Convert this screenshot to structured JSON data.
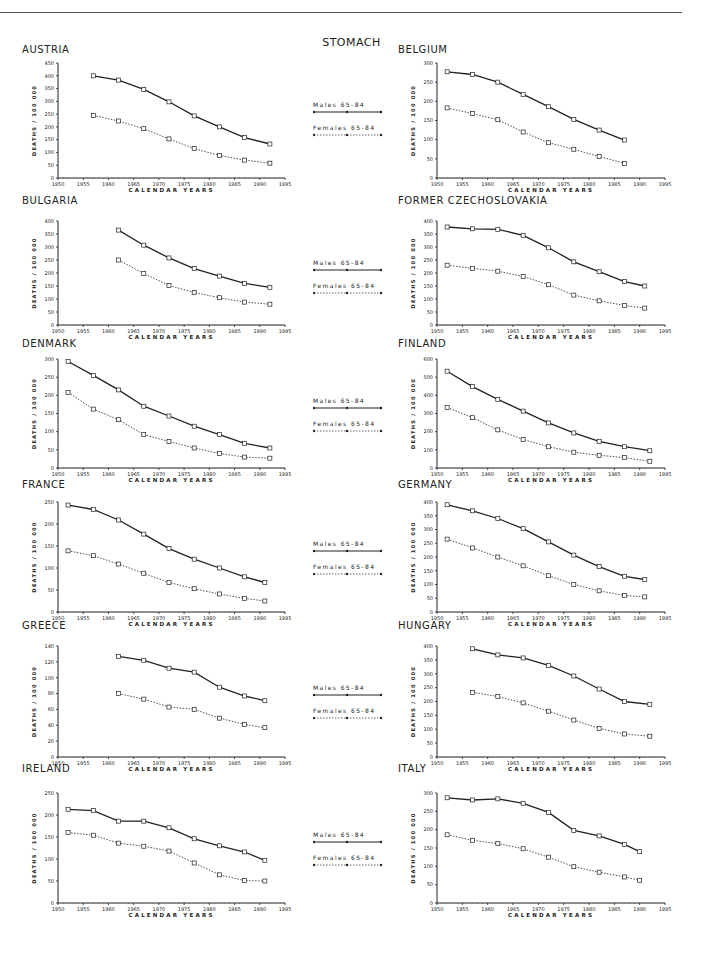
{
  "page": {
    "title": "STOMACH"
  },
  "legend": {
    "males": "Males 65-84",
    "females": "Females 65-84"
  },
  "axes": {
    "xlabel": "CALENDAR YEARS",
    "ylabel": "DEATHS / 100 000",
    "xticks": [
      1950,
      1955,
      1960,
      1965,
      1970,
      1975,
      1980,
      1985,
      1990,
      1995
    ]
  },
  "chart_data": [
    {
      "type": "line",
      "title": "AUSTRIA",
      "xlabel": "CALENDAR YEARS",
      "ylabel": "DEATHS / 100 000",
      "ylim": [
        0,
        450
      ],
      "ystep": 50,
      "x": [
        1957,
        1962,
        1967,
        1972,
        1977,
        1982,
        1987,
        1992
      ],
      "series": [
        {
          "name": "Males 65-84",
          "values": [
            400,
            383,
            347,
            298,
            243,
            200,
            158,
            133
          ]
        },
        {
          "name": "Females 65-84",
          "values": [
            245,
            223,
            193,
            153,
            115,
            88,
            70,
            58
          ]
        }
      ]
    },
    {
      "type": "line",
      "title": "BELGIUM",
      "xlabel": "CALENDAR YEARS",
      "ylabel": "DEATHS / 100 000",
      "ylim": [
        0,
        300
      ],
      "ystep": 50,
      "x": [
        1952,
        1957,
        1962,
        1967,
        1972,
        1977,
        1982,
        1987
      ],
      "series": [
        {
          "name": "Males 65-84",
          "values": [
            277,
            270,
            250,
            218,
            186,
            153,
            125,
            99
          ]
        },
        {
          "name": "Females 65-84",
          "values": [
            183,
            168,
            152,
            120,
            92,
            75,
            56,
            38
          ]
        }
      ]
    },
    {
      "type": "line",
      "title": "BULGARIA",
      "xlabel": "CALENDAR YEARS",
      "ylabel": "DEATHS / 100 000",
      "ylim": [
        0,
        400
      ],
      "ystep": 50,
      "x": [
        1962,
        1967,
        1972,
        1977,
        1982,
        1987,
        1992
      ],
      "series": [
        {
          "name": "Males 65-84",
          "values": [
            365,
            307,
            258,
            217,
            188,
            160,
            145
          ]
        },
        {
          "name": "Females 65-84",
          "values": [
            250,
            198,
            152,
            125,
            105,
            88,
            80
          ]
        }
      ]
    },
    {
      "type": "line",
      "title": "FORMER CZECHOSLOVAKIA",
      "xlabel": "CALENDAR YEARS",
      "ylabel": "DEATHS / 100 000",
      "ylim": [
        0,
        400
      ],
      "ystep": 50,
      "x": [
        1952,
        1957,
        1962,
        1967,
        1972,
        1977,
        1982,
        1987,
        1991
      ],
      "series": [
        {
          "name": "Males 65-84",
          "values": [
            377,
            370,
            368,
            345,
            297,
            243,
            205,
            167,
            150
          ]
        },
        {
          "name": "Females 65-84",
          "values": [
            230,
            218,
            207,
            187,
            155,
            115,
            93,
            75,
            65
          ]
        }
      ]
    },
    {
      "type": "line",
      "title": "DENMARK",
      "xlabel": "CALENDAR YEARS",
      "ylabel": "DEATHS / 100 000",
      "ylim": [
        0,
        300
      ],
      "ystep": 50,
      "x": [
        1952,
        1957,
        1962,
        1967,
        1972,
        1977,
        1982,
        1987,
        1992
      ],
      "series": [
        {
          "name": "Males 65-84",
          "values": [
            293,
            255,
            215,
            170,
            143,
            115,
            92,
            68,
            55
          ]
        },
        {
          "name": "Females 65-84",
          "values": [
            208,
            162,
            133,
            92,
            73,
            55,
            40,
            30,
            27
          ]
        }
      ]
    },
    {
      "type": "line",
      "title": "FINLAND",
      "xlabel": "CALENDAR YEARS",
      "ylabel": "DEATHS / 100 000",
      "ylim": [
        0,
        600
      ],
      "ystep": 100,
      "x": [
        1952,
        1957,
        1962,
        1967,
        1972,
        1977,
        1982,
        1987,
        1992
      ],
      "series": [
        {
          "name": "Males 65-84",
          "values": [
            533,
            448,
            378,
            313,
            248,
            193,
            147,
            117,
            95
          ]
        },
        {
          "name": "Females 65-84",
          "values": [
            333,
            277,
            210,
            157,
            117,
            87,
            70,
            57,
            37
          ]
        }
      ]
    },
    {
      "type": "line",
      "title": "FRANCE",
      "xlabel": "CALENDAR YEARS",
      "ylabel": "DEATHS / 100 000",
      "ylim": [
        0,
        250
      ],
      "ystep": 50,
      "x": [
        1952,
        1957,
        1962,
        1967,
        1972,
        1977,
        1982,
        1987,
        1991
      ],
      "series": [
        {
          "name": "Males 65-84",
          "values": [
            243,
            233,
            209,
            177,
            144,
            120,
            100,
            80,
            67
          ]
        },
        {
          "name": "Females 65-84",
          "values": [
            139,
            128,
            109,
            88,
            67,
            53,
            41,
            31,
            25
          ]
        }
      ]
    },
    {
      "type": "line",
      "title": "GERMANY",
      "xlabel": "CALENDAR YEARS",
      "ylabel": "DEATHS / 100 000",
      "ylim": [
        0,
        400
      ],
      "ystep": 50,
      "x": [
        1952,
        1957,
        1962,
        1967,
        1972,
        1977,
        1982,
        1987,
        1991
      ],
      "series": [
        {
          "name": "Males 65-84",
          "values": [
            390,
            368,
            340,
            303,
            255,
            207,
            165,
            130,
            118
          ]
        },
        {
          "name": "Females 65-84",
          "values": [
            265,
            233,
            200,
            168,
            132,
            100,
            77,
            60,
            55
          ]
        }
      ]
    },
    {
      "type": "line",
      "title": "GREECE",
      "xlabel": "CALENDAR YEARS",
      "ylabel": "DEATHS / 100 000",
      "ylim": [
        0,
        140
      ],
      "ystep": 20,
      "x": [
        1962,
        1967,
        1972,
        1977,
        1982,
        1987,
        1991
      ],
      "series": [
        {
          "name": "Males 65-84",
          "values": [
            127,
            122,
            112,
            107,
            88,
            77,
            71
          ]
        },
        {
          "name": "Females 65-84",
          "values": [
            80,
            73,
            63,
            60,
            49,
            41,
            37
          ]
        }
      ]
    },
    {
      "type": "line",
      "title": "HUNGARY",
      "xlabel": "CALENDAR YEARS",
      "ylabel": "DEATHS / 100 000",
      "ylim": [
        0,
        400
      ],
      "ystep": 50,
      "x": [
        1957,
        1962,
        1967,
        1972,
        1977,
        1982,
        1987,
        1992
      ],
      "series": [
        {
          "name": "Males 65-84",
          "values": [
            390,
            368,
            357,
            330,
            292,
            245,
            200,
            190
          ]
        },
        {
          "name": "Females 65-84",
          "values": [
            233,
            218,
            195,
            165,
            133,
            103,
            83,
            75
          ]
        }
      ]
    },
    {
      "type": "line",
      "title": "IRELAND",
      "xlabel": "CALENDAR YEARS",
      "ylabel": "DEATHS / 100 000",
      "ylim": [
        0,
        250
      ],
      "ystep": 50,
      "x": [
        1952,
        1957,
        1962,
        1967,
        1972,
        1977,
        1982,
        1987,
        1991
      ],
      "series": [
        {
          "name": "Males 65-84",
          "values": [
            213,
            210,
            186,
            186,
            171,
            146,
            130,
            116,
            97
          ]
        },
        {
          "name": "Females 65-84",
          "values": [
            160,
            154,
            136,
            129,
            118,
            91,
            64,
            51,
            50
          ]
        }
      ]
    },
    {
      "type": "line",
      "title": "ITALY",
      "xlabel": "CALENDAR YEARS",
      "ylabel": "DEATHS / 100 000",
      "ylim": [
        0,
        300
      ],
      "ystep": 50,
      "x": [
        1952,
        1957,
        1962,
        1967,
        1972,
        1977,
        1982,
        1987,
        1990
      ],
      "series": [
        {
          "name": "Males 65-84",
          "values": [
            287,
            281,
            284,
            272,
            247,
            198,
            183,
            160,
            140
          ]
        },
        {
          "name": "Females 65-84",
          "values": [
            186,
            171,
            162,
            148,
            125,
            99,
            84,
            71,
            62
          ]
        }
      ]
    }
  ]
}
